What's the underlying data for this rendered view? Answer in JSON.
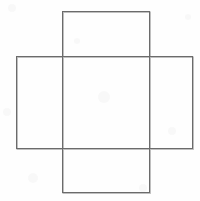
{
  "figure": {
    "type": "line-drawing",
    "background_color": "#fefefe",
    "canvas": {
      "width": 200,
      "height": 201
    },
    "stroke": {
      "color": "#6b6b6b",
      "shadow_color": "#b9b9b9",
      "width": 1
    },
    "shapes": [
      {
        "name": "vertical-rectangle",
        "label": "Tall rectangle",
        "x": 62,
        "y": 11,
        "width": 87,
        "height": 181,
        "orientation": "portrait"
      },
      {
        "name": "horizontal-rectangle",
        "label": "Wide rectangle",
        "x": 16,
        "y": 56,
        "width": 176,
        "height": 92,
        "orientation": "landscape"
      }
    ],
    "overlap_region": {
      "name": "central-intersection",
      "x": 62,
      "y": 56,
      "width": 87,
      "height": 92
    },
    "intersection_points": [
      {
        "name": "top-left-crossing",
        "x": 62,
        "y": 56
      },
      {
        "name": "top-right-crossing",
        "x": 149,
        "y": 56
      },
      {
        "name": "bottom-left-crossing",
        "x": 62,
        "y": 148
      },
      {
        "name": "bottom-right-crossing",
        "x": 149,
        "y": 148
      }
    ]
  }
}
